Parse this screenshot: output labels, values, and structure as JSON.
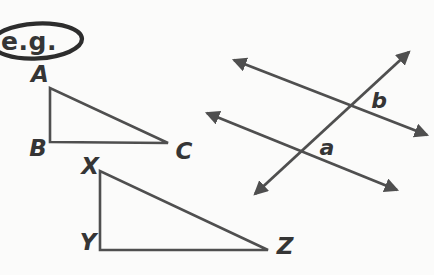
{
  "colors": {
    "background": "#fbfbfa",
    "stroke": "#4f4f4f",
    "label": "#353535",
    "oval": "#2d2d2d"
  },
  "eg_tag": {
    "label": "e.g."
  },
  "triangle_abc": {
    "vertex_a": "A",
    "vertex_b": "B",
    "vertex_c": "C"
  },
  "triangle_xyz": {
    "vertex_x": "X",
    "vertex_y": "Y",
    "vertex_z": "Z"
  },
  "crossing_lines": {
    "angle_a": "a",
    "angle_b": "b"
  }
}
